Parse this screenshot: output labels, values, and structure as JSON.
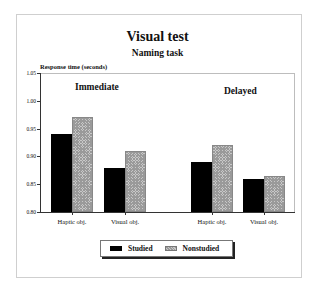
{
  "chart_data": {
    "type": "bar",
    "title": "Visual test",
    "subtitle": "Naming task",
    "ylabel": "Response time (seconds)",
    "xlabel": "",
    "ylim": [
      0.8,
      1.05
    ],
    "yticks": [
      "1.05",
      "1.00",
      "0.95",
      "0.90",
      "0.85",
      "0.80"
    ],
    "grid": false,
    "legend_position": "bottom",
    "groups": [
      {
        "name": "Immediate",
        "categories": [
          "Haptic obj.",
          "Visual obj."
        ],
        "series": [
          {
            "name": "Studied",
            "values": [
              0.94,
              0.88
            ]
          },
          {
            "name": "Nonstudied",
            "values": [
              0.97,
              0.91
            ]
          }
        ]
      },
      {
        "name": "Delayed",
        "categories": [
          "Haptic obj.",
          "Visual obj."
        ],
        "series": [
          {
            "name": "Studied",
            "values": [
              0.89,
              0.86
            ]
          },
          {
            "name": "Nonstudied",
            "values": [
              0.92,
              0.865
            ]
          }
        ]
      }
    ],
    "legend": [
      "Studied",
      "Nonstudied"
    ],
    "colors": {
      "Studied": "#000000",
      "Nonstudied": "#c0c0c0"
    }
  }
}
